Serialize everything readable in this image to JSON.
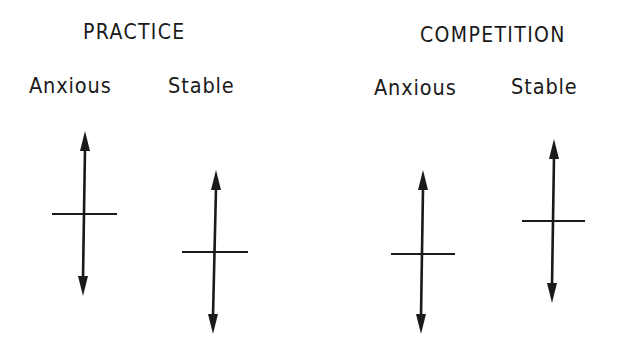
{
  "groups": [
    {
      "title": "PRACTICE",
      "columns": [
        {
          "label": "Anxious",
          "arrow": {
            "x_top": 85,
            "x_bottom": 83,
            "top_y": 131,
            "bottom_y": 296,
            "crossbar_y": 214,
            "crossbar_x1": 52,
            "crossbar_x2": 117
          }
        },
        {
          "label": "Stable",
          "arrow": {
            "x_top": 216,
            "x_bottom": 213,
            "top_y": 170,
            "bottom_y": 334,
            "crossbar_y": 252,
            "crossbar_x1": 182,
            "crossbar_x2": 248
          }
        }
      ]
    },
    {
      "title": "COMPETITION",
      "columns": [
        {
          "label": "Anxious",
          "arrow": {
            "x_top": 423,
            "x_bottom": 421,
            "top_y": 170,
            "bottom_y": 334,
            "crossbar_y": 254,
            "crossbar_x1": 391,
            "crossbar_x2": 455
          }
        },
        {
          "label": "Stable",
          "arrow": {
            "x_top": 554,
            "x_bottom": 552,
            "top_y": 139,
            "bottom_y": 303,
            "crossbar_y": 221,
            "crossbar_x1": 522,
            "crossbar_x2": 585
          }
        }
      ]
    }
  ],
  "icons": {
    "arrow": "double-headed-vertical-arrow",
    "crossbar": "horizontal-tick-mark"
  },
  "colors": {
    "ink": "#1a1a1a",
    "background": "#ffffff"
  }
}
